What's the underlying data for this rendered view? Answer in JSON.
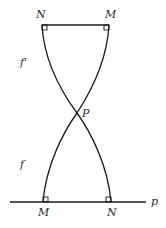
{
  "diagram": {
    "top_points": [
      {
        "label": "N",
        "x": 42,
        "y": 25,
        "label_x": 36,
        "label_y": 18
      },
      {
        "label": "M",
        "x": 109,
        "y": 25,
        "label_x": 105,
        "label_y": 18
      }
    ],
    "bottom_points": [
      {
        "label": "M",
        "x": 43,
        "y": 202,
        "label_x": 38,
        "label_y": 216
      },
      {
        "label": "N",
        "x": 111,
        "y": 202,
        "label_x": 107,
        "label_y": 216
      }
    ],
    "intersection": {
      "label": "P",
      "x": 77,
      "y": 113,
      "label_x": 82,
      "label_y": 117
    },
    "line": {
      "label": "p",
      "label_x": 151,
      "label_y": 205,
      "x1": 10,
      "x2": 146,
      "y": 202
    },
    "curve_labels": [
      {
        "label": "f'",
        "x": 20,
        "y": 66
      },
      {
        "label": "f",
        "x": 20,
        "y": 168
      }
    ],
    "stroke_color": "#1a1a1a"
  }
}
